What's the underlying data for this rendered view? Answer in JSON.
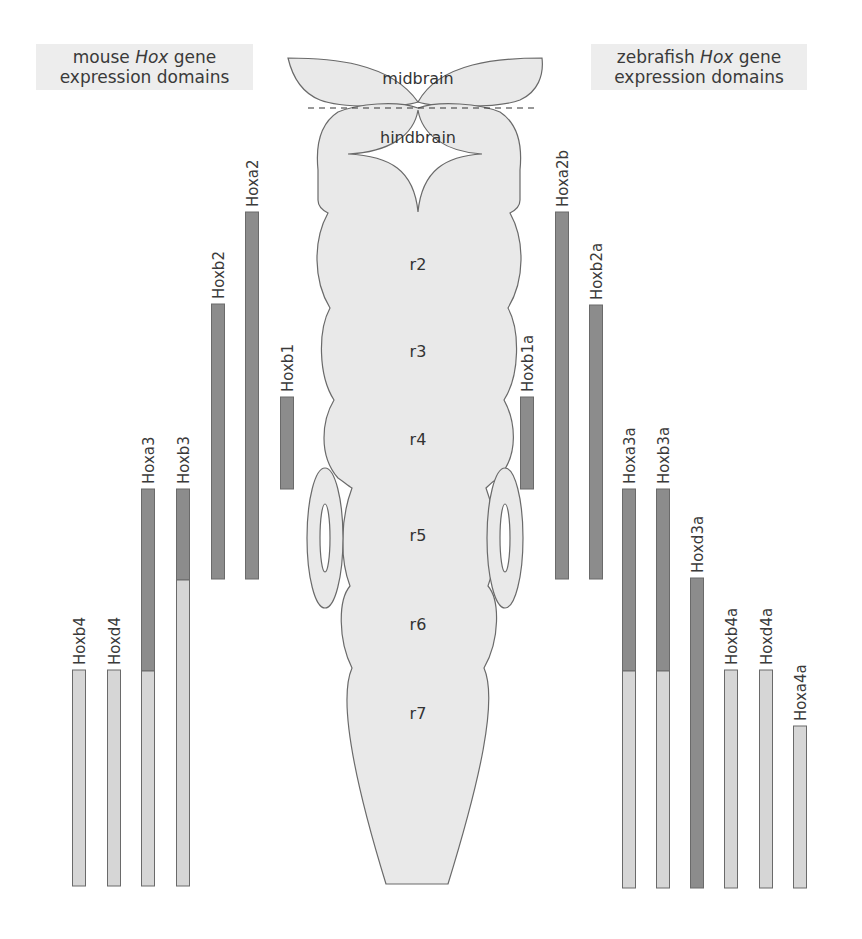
{
  "titles": {
    "mouse": {
      "prefix": "mouse ",
      "italic": "Hox",
      "suffix": " gene",
      "line2": "expression domains"
    },
    "zebrafish": {
      "prefix": "zebrafish ",
      "italic": "Hox",
      "suffix": " gene",
      "line2": "expression domains"
    }
  },
  "brain": {
    "midbrain_label": "midbrain",
    "hindbrain_label": "hindbrain",
    "rhombomeres": [
      "r2",
      "r3",
      "r4",
      "r5",
      "r6",
      "r7"
    ]
  },
  "colors": {
    "dark_bar": "#8c8c8c",
    "light_bar": "#d6d6d6",
    "lighter_bar": "#e2e2e2",
    "tissue": "#e9e9e9",
    "outline": "#6a6a6a",
    "title_bg": "#ededed"
  },
  "mouse_genes": [
    {
      "name": "Hoxb4",
      "x": 79,
      "top": 670,
      "dark_end": 670,
      "bottom": 886
    },
    {
      "name": "Hoxd4",
      "x": 114,
      "top": 670,
      "dark_end": 670,
      "bottom": 886
    },
    {
      "name": "Hoxa3",
      "x": 148,
      "top": 489,
      "dark_end": 671,
      "bottom": 886
    },
    {
      "name": "Hoxb3",
      "x": 183,
      "top": 489,
      "dark_end": 580,
      "bottom": 886
    },
    {
      "name": "Hoxb2",
      "x": 218,
      "top": 304,
      "dark_end": 579,
      "bottom": 579
    },
    {
      "name": "Hoxa2",
      "x": 252,
      "top": 212,
      "dark_end": 579,
      "bottom": 579
    },
    {
      "name": "Hoxb1",
      "x": 287,
      "top": 397,
      "dark_end": 489,
      "bottom": 489
    }
  ],
  "zebrafish_genes": [
    {
      "name": "Hoxb1a",
      "x": 527,
      "top": 397,
      "dark_end": 489,
      "bottom": 489
    },
    {
      "name": "Hoxa2b",
      "x": 562,
      "top": 212,
      "dark_end": 579,
      "bottom": 579
    },
    {
      "name": "Hoxb2a",
      "x": 596,
      "top": 305,
      "dark_end": 579,
      "bottom": 579
    },
    {
      "name": "Hoxa3a",
      "x": 629,
      "top": 489,
      "dark_end": 671,
      "bottom": 888
    },
    {
      "name": "Hoxb3a",
      "x": 663,
      "top": 489,
      "dark_end": 671,
      "bottom": 888
    },
    {
      "name": "Hoxd3a",
      "x": 697,
      "top": 578,
      "dark_end": 888,
      "bottom": 888
    },
    {
      "name": "Hoxb4a",
      "x": 731,
      "top": 670,
      "dark_end": 670,
      "bottom": 888
    },
    {
      "name": "Hoxd4a",
      "x": 766,
      "top": 670,
      "dark_end": 670,
      "bottom": 888
    },
    {
      "name": "Hoxa4a",
      "x": 800,
      "top": 726,
      "dark_end": 726,
      "bottom": 888
    }
  ]
}
